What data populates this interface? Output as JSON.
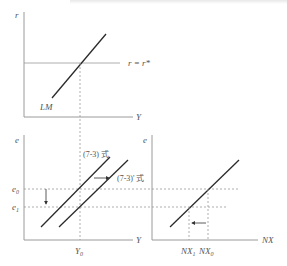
{
  "diagram": {
    "type": "economics-three-panel",
    "top_panel": {
      "y_axis_label": "r",
      "x_axis_label": "Y",
      "curve_label": "LM",
      "horizontal_line_label": "r = r*"
    },
    "bottom_left_panel": {
      "y_axis_label": "e",
      "x_axis_label": "Y",
      "curve_1_label": "(7-3) 式",
      "curve_2_label": "(7-3)' 式",
      "e_level_0": "e",
      "e_level_0_sub": "0",
      "e_level_1": "e",
      "e_level_1_sub": "1",
      "x_tick": "Y",
      "x_tick_sub": "0"
    },
    "bottom_right_panel": {
      "y_axis_label": "e",
      "x_axis_label": "NX",
      "tick_1": "NX",
      "tick_1_sub": "1",
      "tick_0": "NX",
      "tick_0_sub": "0"
    }
  }
}
